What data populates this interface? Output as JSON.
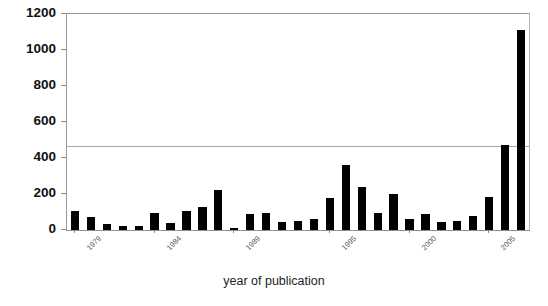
{
  "chart_data": {
    "type": "bar",
    "title": "",
    "xlabel": "year of publication",
    "ylabel": "",
    "ylim": [
      0,
      1200
    ],
    "ytick_values": [
      0,
      200,
      400,
      600,
      800,
      1000,
      1200
    ],
    "ytick_labels": [
      "0",
      "200",
      "400",
      "600",
      "800",
      "1000",
      "1200"
    ],
    "grid": false,
    "legend": null,
    "bar_color": "#000000",
    "axis_color": "#8c8c8c",
    "categories": [
      "1979",
      "1980",
      "1981",
      "1982",
      "1983",
      "1984",
      "1985",
      "1986",
      "1987",
      "1988",
      "1989",
      "1990",
      "1991",
      "1992",
      "1993",
      "1994",
      "1995",
      "1996",
      "1997",
      "1998",
      "1999",
      "2000",
      "2001",
      "2002",
      "2003",
      "2004",
      "2005",
      "2006",
      "2007"
    ],
    "values": [
      105,
      70,
      35,
      20,
      25,
      95,
      40,
      105,
      130,
      225,
      10,
      90,
      95,
      45,
      50,
      60,
      180,
      360,
      240,
      95,
      200,
      60,
      90,
      45,
      50,
      80,
      185,
      475,
      1110
    ],
    "xtick_labels": [
      "1979",
      "1984",
      "1989",
      "1995",
      "2000",
      "2005"
    ],
    "xtick_categories": [
      "1979",
      "1984",
      "1989",
      "1995",
      "2000",
      "2005"
    ]
  }
}
